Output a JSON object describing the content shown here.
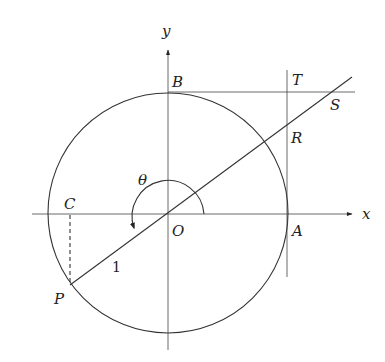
{
  "diagram": {
    "axes": {
      "x_label": "x",
      "y_label": "y"
    },
    "points": {
      "O": "O",
      "A": "A",
      "B": "B",
      "C": "C",
      "P": "P",
      "R": "R",
      "S": "S",
      "T": "T"
    },
    "angle_label": "θ",
    "segment_label": "1",
    "colors": {
      "stroke": "#333333",
      "background": "#ffffff"
    }
  }
}
